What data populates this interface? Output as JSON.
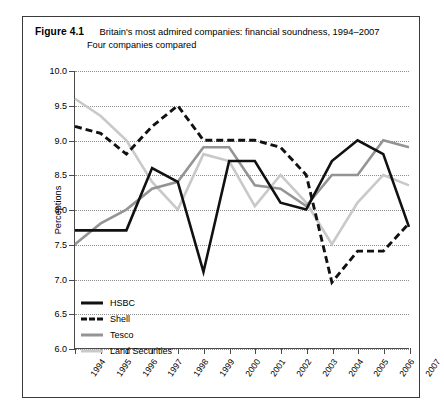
{
  "figure": {
    "label": "Figure 4.1",
    "title": "Britain's most admired companies: financial soundness, 1994–2007",
    "subtitle": "Four companies compared"
  },
  "axes": {
    "y_title": "Perceptions",
    "y_ticks": [
      "10.0",
      "9.5",
      "9.0",
      "8.5",
      "8.0",
      "7.5",
      "7.0",
      "6.5",
      "6.0"
    ],
    "x_ticks": [
      "1994",
      "1995",
      "1996",
      "1997",
      "1998",
      "1999",
      "2000",
      "2001",
      "2002",
      "2003",
      "2004",
      "2005",
      "2006",
      "2007"
    ]
  },
  "legend": {
    "items": [
      {
        "label": "HSBC",
        "color": "#111111",
        "style": "solid"
      },
      {
        "label": "Shell",
        "color": "#111111",
        "style": "dashed"
      },
      {
        "label": "Tesco",
        "color": "#949494",
        "style": "solid"
      },
      {
        "label": "Land Securities",
        "color": "#c9c9c9",
        "style": "solid"
      }
    ]
  },
  "chart_data": {
    "type": "line",
    "title": "Britain's most admired companies: financial soundness, 1994–2007",
    "subtitle": "Four companies compared",
    "xlabel": "",
    "ylabel": "Perceptions",
    "ylim": [
      6.0,
      10.0
    ],
    "ytick_step": 0.5,
    "grid": true,
    "legend_position": "inside-bottom-left",
    "x": [
      "1994",
      "1995",
      "1996",
      "1997",
      "1998",
      "1999",
      "2000",
      "2001",
      "2002",
      "2003",
      "2004",
      "2005",
      "2006",
      "2007"
    ],
    "series": [
      {
        "name": "HSBC",
        "color": "#111111",
        "style": "solid",
        "values": [
          7.7,
          7.7,
          7.7,
          8.6,
          8.4,
          7.1,
          8.7,
          8.7,
          8.1,
          8.0,
          8.7,
          9.0,
          8.8,
          7.75
        ]
      },
      {
        "name": "Shell",
        "color": "#111111",
        "style": "dashed",
        "values": [
          9.2,
          9.1,
          8.8,
          9.2,
          9.5,
          9.0,
          9.0,
          9.0,
          8.9,
          8.5,
          6.95,
          7.4,
          7.4,
          7.8
        ]
      },
      {
        "name": "Tesco",
        "color": "#949494",
        "style": "solid",
        "values": [
          7.5,
          7.8,
          8.0,
          8.3,
          8.4,
          8.9,
          8.9,
          8.35,
          8.3,
          8.05,
          8.5,
          8.5,
          9.0,
          8.9
        ]
      },
      {
        "name": "Land Securities",
        "color": "#c9c9c9",
        "style": "solid",
        "values": [
          9.6,
          9.35,
          9.0,
          8.4,
          8.0,
          8.8,
          8.7,
          8.05,
          8.5,
          8.1,
          7.5,
          8.1,
          8.5,
          8.35
        ]
      }
    ]
  }
}
